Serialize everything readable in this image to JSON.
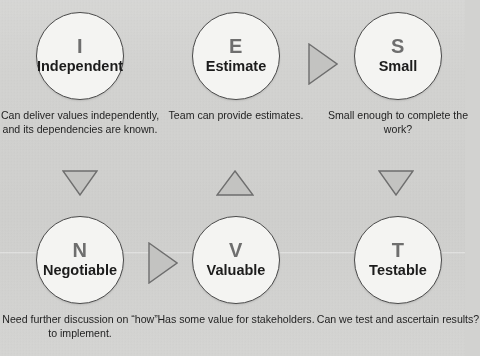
{
  "diagram": {
    "colors": {
      "background": "#d3d3d1",
      "circle_fill": "#f4f4f2",
      "circle_stroke": "#4a4a4a",
      "letter": "#6e6e6e",
      "word": "#1c1c1c",
      "caption": "#1f1f1f",
      "arrow_fill": "#c0c0be",
      "arrow_stroke": "#707070"
    },
    "nodes": [
      {
        "id": "independent",
        "letter": "I",
        "word": "Independent",
        "caption": "Can deliver values independently, and its dependencies are known."
      },
      {
        "id": "negotiable",
        "letter": "N",
        "word": "Negotiable",
        "caption": "Need further discussion on “how” to implement."
      },
      {
        "id": "valuable",
        "letter": "V",
        "word": "Valuable",
        "caption": "Has some value for stakeholders."
      },
      {
        "id": "estimate",
        "letter": "E",
        "word": "Estimate",
        "caption": "Team can provide estimates."
      },
      {
        "id": "small",
        "letter": "S",
        "word": "Small",
        "caption": "Small enough to complete the work?"
      },
      {
        "id": "testable",
        "letter": "T",
        "word": "Testable",
        "caption": "Can we test and ascertain results?"
      }
    ],
    "arrows": [
      {
        "id": "independent-to-negotiable",
        "direction": "down",
        "from": "independent",
        "to": "negotiable"
      },
      {
        "id": "negotiable-to-valuable",
        "direction": "right",
        "from": "negotiable",
        "to": "valuable"
      },
      {
        "id": "valuable-to-estimate",
        "direction": "up",
        "from": "valuable",
        "to": "estimate"
      },
      {
        "id": "estimate-to-small",
        "direction": "right",
        "from": "estimate",
        "to": "small"
      },
      {
        "id": "small-to-testable",
        "direction": "down",
        "from": "small",
        "to": "testable"
      }
    ]
  }
}
